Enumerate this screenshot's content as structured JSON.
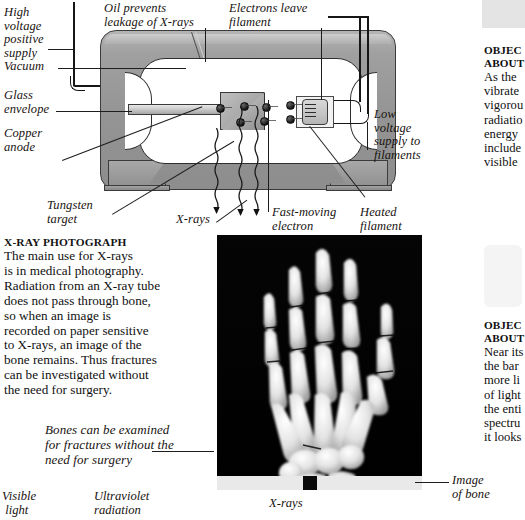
{
  "diagram": {
    "labels": {
      "high_voltage": "High\nvoltage\npositive\nsupply",
      "vacuum": "Vacuum",
      "glass_envelope": "Glass\nenvelope",
      "copper_anode": "Copper\nanode",
      "tungsten_target": "Tungsten\ntarget",
      "oil_prevents": "Oil prevents\nleakage of X-rays",
      "electrons_leave": "Electrons leave\nfilament",
      "low_voltage": "Low\nvoltage\nsupply to\nfilaments",
      "x_rays": "X-rays",
      "fast_moving_electron": "Fast-moving\nelectron",
      "heated_filament": "Heated\nfilament"
    }
  },
  "photo_article": {
    "heading": "X-RAY PHOTOGRAPH",
    "body": "The main use for X-rays\nis in medical photography.\nRadiation from an X-ray tube\ndoes not pass through bone,\nso when an image is\nrecorded on paper sensitive\nto X-rays, an image of the\nbone remains. Thus fractures\ncan be investigated without\nthe need for surgery."
  },
  "photo_caption": {
    "text": "Bones can be examined\nfor fractures without the\nneed for surgery"
  },
  "photo": {
    "alt": "x-ray-photograph-of-hand",
    "image_of_bone_label": "Image\nof bone"
  },
  "sidebar": {
    "top_entry": {
      "heading_line1": "OBJEC",
      "heading_line2": "ABOUT",
      "body": "As the\nvibrate\nvigorou\nradiatio\nenergy\ninclude\nvisible"
    },
    "bottom_entry": {
      "heading_line1": "OBJEC",
      "heading_line2": "ABOUT",
      "body": "Near its\nthe bar\nmore li\nof light\nthe enti\nspectru\nit looks"
    }
  },
  "spectrum_labels": {
    "visible_light": "Visible\n light",
    "ultraviolet": "Ultraviolet\nradiation",
    "x_rays": "X-rays"
  },
  "colors": {
    "housing_gray": "#9a9a9a",
    "housing_outline": "#3b3b3b",
    "film_black": "#000000",
    "sidebar_box": "#e4e4e4",
    "text": "#141414"
  }
}
